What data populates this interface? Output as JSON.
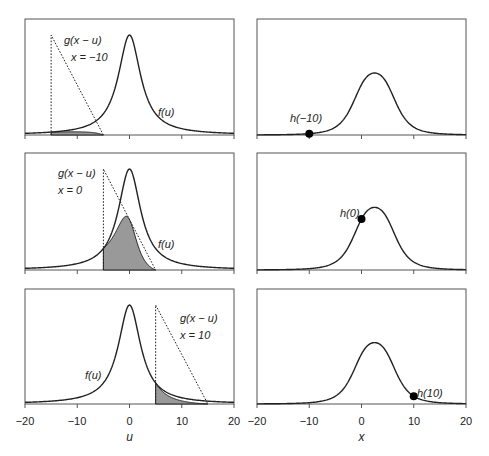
{
  "chart_data": {
    "type": "line",
    "title": "",
    "layout": "3x2 grid of panels illustrating convolution h(x) = ∫ f(u) g(x-u) du",
    "panels": [
      {
        "row": 0,
        "col": 0,
        "curves": [
          "f(u)",
          "g(x - u)"
        ],
        "x": -10,
        "labels": {
          "g": "g(x − u)",
          "x": "x = −10",
          "f": "f(u)"
        },
        "g_triangle": {
          "u_start": -15,
          "u_end": -5,
          "peak_at": -15
        },
        "shaded_overlap": true
      },
      {
        "row": 0,
        "col": 1,
        "curves": [
          "h(x)"
        ],
        "point": {
          "x": -10,
          "label": "h(−10)"
        }
      },
      {
        "row": 1,
        "col": 0,
        "curves": [
          "f(u)",
          "g(x - u)"
        ],
        "x": 0,
        "labels": {
          "g": "g(x − u)",
          "x": "x = 0",
          "f": "f(u)"
        },
        "g_triangle": {
          "u_start": -5,
          "u_end": 5,
          "peak_at": -5
        },
        "shaded_overlap": true
      },
      {
        "row": 1,
        "col": 1,
        "curves": [
          "h(x)"
        ],
        "point": {
          "x": 0,
          "label": "h(0)"
        }
      },
      {
        "row": 2,
        "col": 0,
        "curves": [
          "f(u)",
          "g(x - u)"
        ],
        "x": 10,
        "labels": {
          "g": "g(x − u)",
          "x": "x = 10",
          "f": "f(u)"
        },
        "g_triangle": {
          "u_start": 5,
          "u_end": 15,
          "peak_at": 5
        },
        "shaded_overlap": true
      },
      {
        "row": 2,
        "col": 1,
        "curves": [
          "h(x)"
        ],
        "point": {
          "x": 10,
          "label": "h(10)"
        }
      }
    ],
    "f_peak_at": 0,
    "h_peak_at": 2.5,
    "xlim": [
      -20,
      20
    ],
    "xticks": [
      -20,
      -10,
      0,
      10,
      20
    ],
    "xlabel_left": "u",
    "xlabel_right": "x",
    "grid": false
  },
  "labels": {
    "g1": "g(x − u)",
    "x1": "x = −10",
    "f1": "f(u)",
    "h1": "h(−10)",
    "g2": "g(x − u)",
    "x2": "x = 0",
    "f2": "f(u)",
    "h2": "h(0)",
    "g3": "g(x − u)",
    "x3": "x = 10",
    "f3": "f(u)",
    "h3": "h(10)"
  },
  "axes": {
    "ticks": [
      "−20",
      "−10",
      "0",
      "10",
      "20"
    ],
    "xlabel_left": "u",
    "xlabel_right": "x"
  }
}
